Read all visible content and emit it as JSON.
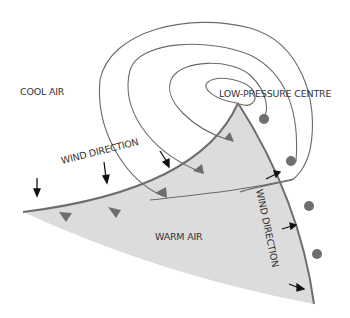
{
  "diagram": {
    "type": "weather-front-depression",
    "labels": {
      "cool_air": "COOL AIR",
      "low_pressure_centre": "LOW-PRESSURE CENTRE",
      "wind_direction_cold_side": "WIND DIRECTION",
      "wind_direction_warm_side": "WIND DIRECTION",
      "warm_air": "WARM AIR"
    },
    "colors": {
      "background": "#ffffff",
      "warm_sector_fill": "#dcdcdc",
      "front_line": "#6e6e6e",
      "front_symbols": "#6e6e6e",
      "isobar": "#6a6a6a",
      "arrow": "#111111",
      "text": "#333333"
    },
    "elements": {
      "isobars_count": 4,
      "cold_front_triangles": 5,
      "warm_front_semicircles": 4,
      "wind_arrows_cool_side": 3,
      "wind_arrows_warm_side": 3
    }
  }
}
